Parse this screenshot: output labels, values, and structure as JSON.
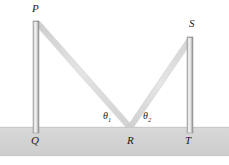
{
  "figure": {
    "width": 229,
    "height": 165,
    "background_color": "#ffffff",
    "ground_color": "#d4d4d4",
    "ground_edge_color": "#c2c2c2",
    "ray_color": "#dcdcdc",
    "ray_edge_color": "#cfcfcf",
    "pole_color_light": "#f2f2f2",
    "pole_color_mid": "#c9c9c9",
    "pole_color_dark": "#9a9a9a",
    "label_color": "#1a1a1a"
  },
  "labels": {
    "P": "P",
    "Q": "Q",
    "R": "R",
    "S": "S",
    "T": "T",
    "theta1": "θ",
    "theta1_sub": "1",
    "theta2": "θ",
    "theta2_sub": "2"
  },
  "geometry": {
    "ground": {
      "x": 0,
      "y": 127,
      "width": 229,
      "height": 29
    },
    "left_pole": {
      "x": 33,
      "y": 21,
      "width": 6,
      "height": 112,
      "top_label": "P",
      "base_label": "Q"
    },
    "right_pole": {
      "x": 187,
      "y": 37,
      "width": 6,
      "height": 96,
      "top_label": "S",
      "base_label": "T"
    },
    "incident_ray": {
      "from": "P",
      "x1": 37,
      "y1": 23,
      "x2": 130,
      "y2": 127
    },
    "reflected_ray": {
      "from": "R",
      "x1": 130,
      "y1": 127,
      "x2": 190,
      "y2": 39
    },
    "reflection_point": {
      "label": "R",
      "x": 130,
      "y": 127
    }
  }
}
